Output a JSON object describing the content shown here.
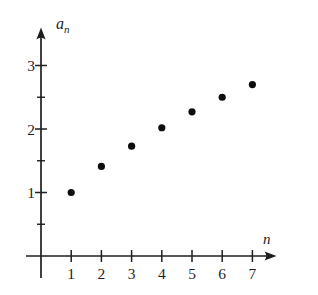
{
  "figure": {
    "background": "#ffffff",
    "ink_color": "#1f1f1f",
    "point_color": "#0d0d0d"
  },
  "chart_data": {
    "type": "scatter",
    "title": "",
    "xlabel": "n",
    "ylabel_base": "a",
    "ylabel_sub": "n",
    "x": [
      1,
      2,
      3,
      4,
      5,
      6,
      7
    ],
    "series": [
      {
        "name": "a_n",
        "values": [
          1.0,
          1.41,
          1.73,
          2.02,
          2.27,
          2.5,
          2.7
        ]
      }
    ],
    "x_tick_labels": [
      "1",
      "2",
      "3",
      "4",
      "5",
      "6",
      "7"
    ],
    "y_ticks": [
      1,
      2,
      3
    ],
    "y_tick_labels": [
      "1",
      "2",
      "3"
    ],
    "y_minor_ticks": [
      0.5,
      1.5,
      2.5
    ],
    "xlim": [
      0,
      7.8
    ],
    "ylim": [
      0,
      3.6
    ],
    "grid": false,
    "legend": "none"
  }
}
